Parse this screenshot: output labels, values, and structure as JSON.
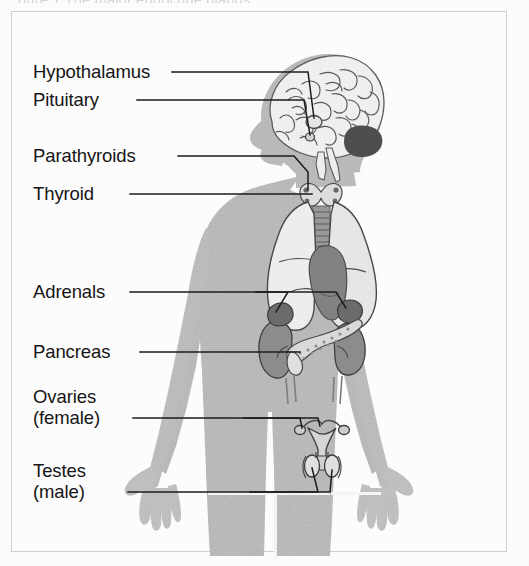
{
  "figure": {
    "cut_off_caption": "gure 1  The major endocrine glands",
    "alt": "Diagram of the human endocrine system"
  },
  "labels": [
    {
      "id": "hypothalamus",
      "text": "Hypothalamus",
      "sub": ""
    },
    {
      "id": "pituitary",
      "text": "Pituitary",
      "sub": ""
    },
    {
      "id": "parathyroids",
      "text": "Parathyroids",
      "sub": ""
    },
    {
      "id": "thyroid",
      "text": "Thyroid",
      "sub": ""
    },
    {
      "id": "adrenals",
      "text": "Adrenals",
      "sub": ""
    },
    {
      "id": "pancreas",
      "text": "Pancreas",
      "sub": ""
    },
    {
      "id": "ovaries",
      "text": "Ovaries",
      "sub": "(female)"
    },
    {
      "id": "testes",
      "text": "Testes",
      "sub": "(male)"
    }
  ],
  "colors": {
    "body_fill": "#b9b9b9",
    "body_fill_light": "#c6c6c6",
    "organ_light": "#efefef",
    "organ_mid": "#a3a3a3",
    "organ_dark": "#6f6f6f",
    "organ_darkest": "#4a4a4a",
    "leader_line": "#1c1c1c",
    "label_text": "#161616",
    "frame_border": "#d2d2d2",
    "page_background": "#ffffff"
  },
  "organs": [
    {
      "name": "brain",
      "label_ref": "hypothalamus"
    },
    {
      "name": "hypothalamus",
      "label_ref": "hypothalamus"
    },
    {
      "name": "pituitary",
      "label_ref": "pituitary"
    },
    {
      "name": "parathyroid-glands",
      "label_ref": "parathyroids"
    },
    {
      "name": "thyroid-gland",
      "label_ref": "thyroid"
    },
    {
      "name": "lungs",
      "label_ref": ""
    },
    {
      "name": "heart",
      "label_ref": ""
    },
    {
      "name": "trachea",
      "label_ref": ""
    },
    {
      "name": "adrenal-glands",
      "label_ref": "adrenals"
    },
    {
      "name": "kidneys",
      "label_ref": ""
    },
    {
      "name": "pancreas",
      "label_ref": "pancreas"
    },
    {
      "name": "ureters",
      "label_ref": ""
    },
    {
      "name": "uterus-ovaries",
      "label_ref": "ovaries"
    },
    {
      "name": "testes",
      "label_ref": "testes"
    }
  ]
}
